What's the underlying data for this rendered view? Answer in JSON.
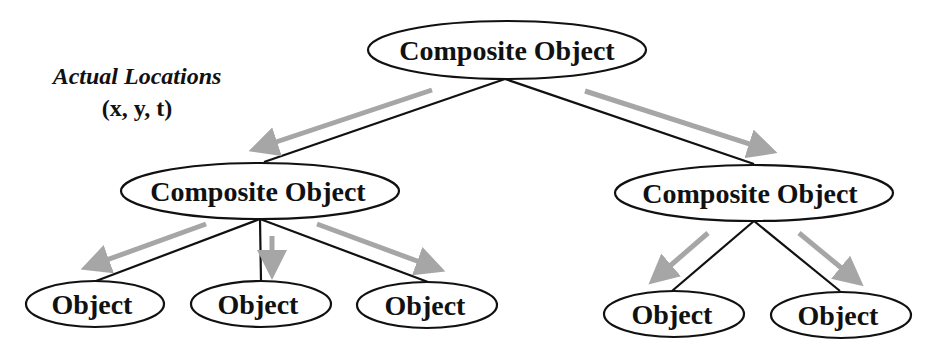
{
  "caption": {
    "title": "Actual Locations",
    "coords": "(x, y, t)"
  },
  "colors": {
    "line": "#111111",
    "arrow": "#a6a6a6",
    "background": "#ffffff"
  },
  "nodes": {
    "root": {
      "label": "Composite Object"
    },
    "left_composite": {
      "label": "Composite Object"
    },
    "right_composite": {
      "label": "Composite Object"
    },
    "left_object_1": {
      "label": "Object"
    },
    "left_object_2": {
      "label": "Object"
    },
    "left_object_3": {
      "label": "Object"
    },
    "right_object_1": {
      "label": "Object"
    },
    "right_object_2": {
      "label": "Object"
    }
  },
  "edges": [
    [
      "root",
      "left_composite"
    ],
    [
      "root",
      "right_composite"
    ],
    [
      "left_composite",
      "left_object_1"
    ],
    [
      "left_composite",
      "left_object_2"
    ],
    [
      "left_composite",
      "left_object_3"
    ],
    [
      "right_composite",
      "right_object_1"
    ],
    [
      "right_composite",
      "right_object_2"
    ]
  ]
}
